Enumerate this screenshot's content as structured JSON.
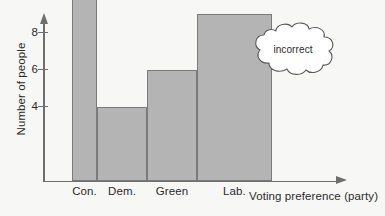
{
  "chart_data": {
    "type": "bar",
    "title": "",
    "xlabel": "Voting preference (party)",
    "ylabel": "Number of people",
    "categories": [
      "Con.",
      "Dem.",
      "Green",
      "Lab."
    ],
    "values": [
      10.9,
      4,
      6,
      9
    ],
    "bar_widths": [
      1,
      2,
      2,
      3
    ],
    "ytick_labels": [
      "10",
      "8",
      "6",
      "4"
    ],
    "ytick_values": [
      10,
      8,
      6,
      4
    ],
    "ylim": [
      0,
      12
    ],
    "grid": false,
    "legend": null,
    "bar_fill_color": "#b4b4b4",
    "bar_edge_color": "#7a7a7a",
    "axis_color": "#6e6e6e",
    "background_color": "#f7f7f5",
    "text_color": "#2b2b2b",
    "annotations": [
      {
        "name": "incorrect-callout",
        "text": "incorrect",
        "shape": "thought-cloud"
      }
    ]
  }
}
